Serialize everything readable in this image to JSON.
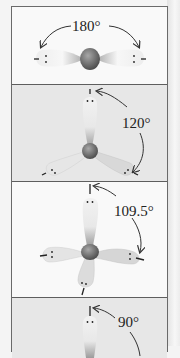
{
  "figure": {
    "panels": [
      {
        "geometry": "linear",
        "angle_label": "180°",
        "lobes": 2,
        "background": "white"
      },
      {
        "geometry": "trigonal-planar",
        "angle_label": "120°",
        "lobes": 3,
        "background": "gray"
      },
      {
        "geometry": "tetrahedral",
        "angle_label": "109.5°",
        "lobes": 4,
        "background": "white"
      },
      {
        "geometry": "octahedral",
        "angle_label": "90°",
        "lobes": 6,
        "background": "gray"
      }
    ]
  },
  "colors": {
    "frame": "#6a6a6a",
    "panel_white": "#f9f9f9",
    "panel_gray": "#e7e7e7",
    "nucleus": "#6f6f6f",
    "lobe_light": "#f4f4f4",
    "lobe_dark": "#9a9a9a"
  }
}
